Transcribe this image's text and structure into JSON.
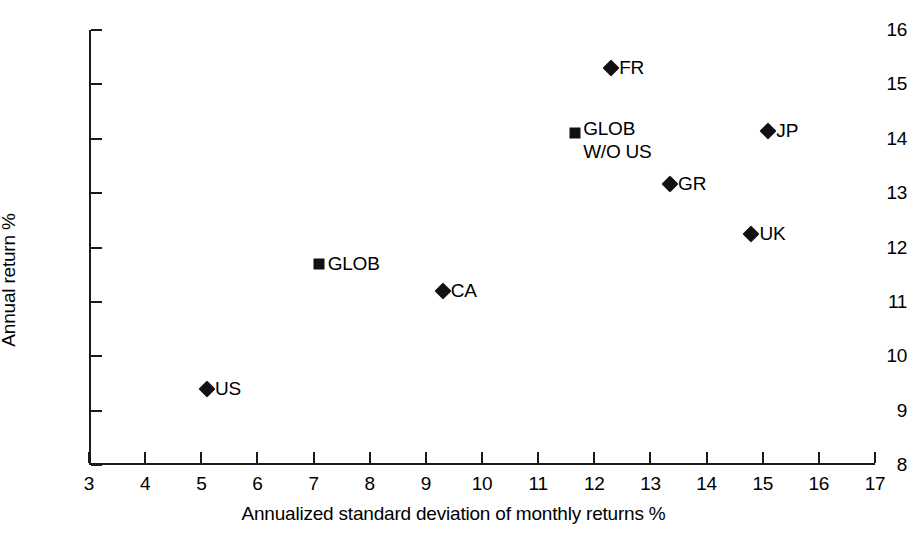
{
  "chart_data": {
    "type": "scatter",
    "title": "",
    "xlabel": "Annualized standard deviation of monthly returns %",
    "ylabel": "Annual return %",
    "xlim": [
      3,
      17
    ],
    "ylim": [
      8,
      16
    ],
    "xticks": [
      "3",
      "4",
      "5",
      "6",
      "7",
      "8",
      "9",
      "10",
      "11",
      "12",
      "13",
      "14",
      "15",
      "16",
      "17"
    ],
    "yticks": [
      "8",
      "9",
      "10",
      "11",
      "12",
      "13",
      "14",
      "15",
      "16"
    ],
    "grid": false,
    "legend": "none",
    "marker_color": "#111111",
    "points": [
      {
        "label": "US",
        "x": 5.1,
        "y": 9.4,
        "marker": "diamond",
        "label_lines": [
          "US"
        ]
      },
      {
        "label": "GLOB",
        "x": 7.1,
        "y": 11.7,
        "marker": "square",
        "label_lines": [
          "GLOB"
        ]
      },
      {
        "label": "CA",
        "x": 9.3,
        "y": 11.2,
        "marker": "diamond",
        "label_lines": [
          "CA"
        ]
      },
      {
        "label": "GLOB W/O US",
        "x": 11.65,
        "y": 14.1,
        "marker": "square",
        "label_lines": [
          "GLOB",
          "W/O US"
        ]
      },
      {
        "label": "FR",
        "x": 12.3,
        "y": 15.3,
        "marker": "diamond",
        "label_lines": [
          "FR"
        ]
      },
      {
        "label": "GR",
        "x": 13.35,
        "y": 13.17,
        "marker": "diamond",
        "label_lines": [
          "GR"
        ]
      },
      {
        "label": "UK",
        "x": 14.8,
        "y": 12.25,
        "marker": "diamond",
        "label_lines": [
          "UK"
        ]
      },
      {
        "label": "JP",
        "x": 15.1,
        "y": 14.14,
        "marker": "diamond",
        "label_lines": [
          "JP"
        ]
      }
    ]
  }
}
